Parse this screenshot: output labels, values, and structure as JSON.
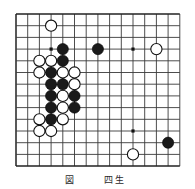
{
  "figure": {
    "type": "go-board-diagram",
    "title": "",
    "caption_left": "図",
    "caption_right": "四 生",
    "board": {
      "cols": 15,
      "rows": 14,
      "cell": 11.7,
      "origin_x": 4,
      "origin_y": 4,
      "line_color": "#3a3a3a",
      "border_color": "#222222",
      "background": "#ffffff",
      "edges": {
        "left": true,
        "top": true,
        "bottom": true,
        "right": false
      }
    },
    "star_points": [
      {
        "col": 3,
        "row": 3
      },
      {
        "col": 10,
        "row": 3
      },
      {
        "col": 10,
        "row": 10
      }
    ],
    "stones": [
      {
        "col": 3,
        "row": 1,
        "color": "white"
      },
      {
        "col": 4,
        "row": 3,
        "color": "black"
      },
      {
        "col": 7,
        "row": 3,
        "color": "black"
      },
      {
        "col": 12,
        "row": 3,
        "color": "white"
      },
      {
        "col": 2,
        "row": 4,
        "color": "white"
      },
      {
        "col": 3,
        "row": 4,
        "color": "white"
      },
      {
        "col": 4,
        "row": 4,
        "color": "black"
      },
      {
        "col": 2,
        "row": 5,
        "color": "white"
      },
      {
        "col": 3,
        "row": 5,
        "color": "black"
      },
      {
        "col": 4,
        "row": 5,
        "color": "white"
      },
      {
        "col": 5,
        "row": 5,
        "color": "white"
      },
      {
        "col": 3,
        "row": 6,
        "color": "black"
      },
      {
        "col": 4,
        "row": 6,
        "color": "black"
      },
      {
        "col": 5,
        "row": 6,
        "color": "white"
      },
      {
        "col": 3,
        "row": 7,
        "color": "black"
      },
      {
        "col": 4,
        "row": 7,
        "color": "white"
      },
      {
        "col": 5,
        "row": 7,
        "color": "black"
      },
      {
        "col": 3,
        "row": 8,
        "color": "black"
      },
      {
        "col": 4,
        "row": 8,
        "color": "white"
      },
      {
        "col": 5,
        "row": 8,
        "color": "black"
      },
      {
        "col": 2,
        "row": 9,
        "color": "white"
      },
      {
        "col": 3,
        "row": 9,
        "color": "black"
      },
      {
        "col": 4,
        "row": 9,
        "color": "white"
      },
      {
        "col": 2,
        "row": 10,
        "color": "white"
      },
      {
        "col": 3,
        "row": 10,
        "color": "white"
      },
      {
        "col": 13,
        "row": 11,
        "color": "black"
      },
      {
        "col": 10,
        "row": 12,
        "color": "white"
      }
    ],
    "stone_style": {
      "radius": 5.6,
      "black_fill": "#1a1a1a",
      "black_stroke": "#000000",
      "white_fill": "#ffffff",
      "white_stroke": "#111111"
    }
  }
}
